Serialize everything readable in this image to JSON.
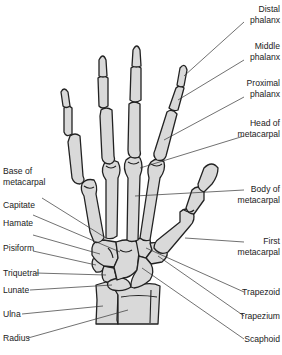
{
  "diagram": {
    "colors": {
      "bone_fill": "#d9d9d9",
      "outline": "#222222",
      "leader": "#333333",
      "text": "#222222",
      "background": "#ffffff"
    },
    "labels_right": [
      {
        "id": "distal-phalanx",
        "line1": "Distal",
        "line2": "phalanx"
      },
      {
        "id": "middle-phalanx",
        "line1": "Middle",
        "line2": "phalanx"
      },
      {
        "id": "proximal-phalanx",
        "line1": "Proximal",
        "line2": "phalanx"
      },
      {
        "id": "head-of-metacarpal",
        "line1": "Head of",
        "line2": "metacarpal"
      },
      {
        "id": "body-of-metacarpal",
        "line1": "Body of",
        "line2": "metacarpal"
      },
      {
        "id": "first-metacarpal",
        "line1": "First",
        "line2": "metacarpal"
      },
      {
        "id": "trapezoid",
        "line1": "Trapezoid"
      },
      {
        "id": "trapezium",
        "line1": "Trapezium"
      },
      {
        "id": "scaphoid",
        "line1": "Scaphoid"
      }
    ],
    "labels_left": [
      {
        "id": "base-of-metacarpal",
        "line1": "Base of",
        "line2": "metacarpal"
      },
      {
        "id": "capitate",
        "line1": "Capitate"
      },
      {
        "id": "hamate",
        "line1": "Hamate"
      },
      {
        "id": "pisiform",
        "line1": "Pisiform"
      },
      {
        "id": "triquetral",
        "line1": "Triquetral"
      },
      {
        "id": "lunate",
        "line1": "Lunate"
      },
      {
        "id": "ulna",
        "line1": "Ulna"
      },
      {
        "id": "radius",
        "line1": "Radius"
      }
    ]
  }
}
